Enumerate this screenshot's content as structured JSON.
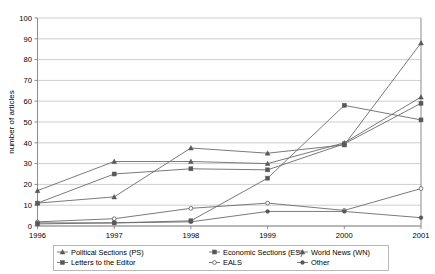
{
  "chart_data": {
    "type": "line",
    "title": "",
    "xlabel": "",
    "ylabel": "number of articles",
    "x": [
      "1996",
      "1997",
      "1998",
      "1999",
      "2000",
      "2001"
    ],
    "categories": [
      "1996",
      "1997",
      "1998",
      "1999",
      "2000",
      "2001"
    ],
    "ylim": [
      0,
      100
    ],
    "yticks": [
      0,
      10,
      20,
      30,
      40,
      50,
      60,
      70,
      80,
      90,
      100
    ],
    "ytick_labels": [
      "0",
      "10",
      "20",
      "30",
      "40",
      "50",
      "60",
      "70",
      "80",
      "90",
      "100"
    ],
    "grid": "horizontal",
    "legend_position": "bottom",
    "series": [
      {
        "name": "Political Sections (PS)",
        "marker": "triangle-filled",
        "values": [
          17,
          31,
          31,
          30,
          40,
          62
        ]
      },
      {
        "name": "Economic Sections (ES)",
        "marker": "square-filled",
        "values": [
          11,
          25,
          27.5,
          27,
          39.5,
          59
        ]
      },
      {
        "name": "World News (WN)",
        "marker": "triangle-filled",
        "values": [
          11,
          14,
          37.5,
          35,
          39,
          88
        ]
      },
      {
        "name": "Letters to the Editor",
        "marker": "square-filled",
        "values": [
          1,
          1.5,
          2.5,
          23,
          58,
          51
        ]
      },
      {
        "name": "EALS",
        "marker": "circle-open",
        "values": [
          2,
          3.5,
          8.5,
          11,
          7.5,
          18
        ]
      },
      {
        "name": "Other",
        "marker": "circle-filled",
        "values": [
          1.5,
          1.5,
          2,
          7,
          7,
          4
        ]
      }
    ]
  },
  "axes": {
    "y_axis_title": "number of articles",
    "y_tick_labels": [
      "100",
      "90",
      "80",
      "70",
      "60",
      "50",
      "40",
      "30",
      "20",
      "10",
      "0"
    ],
    "x_tick_labels": [
      "1996",
      "1997",
      "1998",
      "1999",
      "2000",
      "2001"
    ]
  },
  "legend": {
    "entries": [
      {
        "label": "Political Sections (PS)"
      },
      {
        "label": "Economic Sections (ES)"
      },
      {
        "label": "World News (WN)"
      },
      {
        "label": "Letters to the Editor"
      },
      {
        "label": "EALS"
      },
      {
        "label": "Other"
      }
    ]
  },
  "colors": {
    "line": "#6b6b6b",
    "grid": "#b9b9b9",
    "axis": "#808080",
    "text": "#000000",
    "background": "#ffffff"
  }
}
